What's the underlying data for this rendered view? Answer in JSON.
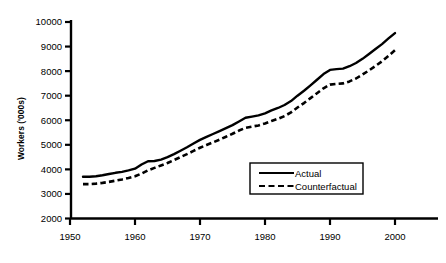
{
  "chart_data": {
    "type": "line",
    "title": "",
    "xlabel": "",
    "ylabel": "Workers ('000s)",
    "xlim": [
      1950,
      2005
    ],
    "ylim": [
      2000,
      10000
    ],
    "xticks": [
      1950,
      1960,
      1970,
      1980,
      1990,
      2000
    ],
    "xticklabels": [
      "1950",
      "1960",
      "1970",
      "1980",
      "1990",
      "2000"
    ],
    "yticks": [
      2000,
      3000,
      4000,
      5000,
      6000,
      7000,
      8000,
      9000,
      10000
    ],
    "yticklabels": [
      "2000",
      "3000",
      "4000",
      "5000",
      "6000",
      "7000",
      "8000",
      "9000",
      "10000"
    ],
    "grid": false,
    "legend_position": "lower right",
    "x": [
      1952,
      1953,
      1954,
      1955,
      1956,
      1957,
      1958,
      1959,
      1960,
      1961,
      1962,
      1963,
      1964,
      1965,
      1966,
      1967,
      1968,
      1969,
      1970,
      1971,
      1972,
      1973,
      1974,
      1975,
      1976,
      1977,
      1978,
      1979,
      1980,
      1981,
      1982,
      1983,
      1984,
      1985,
      1986,
      1987,
      1988,
      1989,
      1990,
      1991,
      1992,
      1993,
      1994,
      1995,
      1996,
      1997,
      1998,
      1999,
      2000
    ],
    "series": [
      {
        "name": "Actual",
        "style": "solid",
        "color": "#000000",
        "values": [
          3700,
          3700,
          3720,
          3760,
          3810,
          3860,
          3900,
          3960,
          4030,
          4200,
          4330,
          4340,
          4400,
          4500,
          4620,
          4760,
          4900,
          5050,
          5200,
          5320,
          5440,
          5560,
          5680,
          5800,
          5950,
          6100,
          6150,
          6200,
          6280,
          6400,
          6500,
          6620,
          6780,
          7000,
          7200,
          7420,
          7650,
          7880,
          8050,
          8080,
          8100,
          8200,
          8330,
          8500,
          8700,
          8900,
          9100,
          9330,
          9550
        ]
      },
      {
        "name": "Counterfactual",
        "style": "dashed",
        "color": "#000000",
        "values": [
          3400,
          3400,
          3420,
          3450,
          3490,
          3540,
          3590,
          3650,
          3720,
          3830,
          3960,
          4060,
          4160,
          4260,
          4380,
          4500,
          4620,
          4750,
          4880,
          4990,
          5100,
          5210,
          5330,
          5450,
          5580,
          5690,
          5740,
          5790,
          5870,
          5970,
          6060,
          6170,
          6320,
          6520,
          6700,
          6900,
          7100,
          7300,
          7450,
          7480,
          7500,
          7580,
          7700,
          7860,
          8030,
          8210,
          8400,
          8620,
          8850
        ]
      }
    ],
    "legend": [
      {
        "label": "Actual",
        "style": "solid"
      },
      {
        "label": "Counterfactual",
        "style": "dashed"
      }
    ]
  }
}
